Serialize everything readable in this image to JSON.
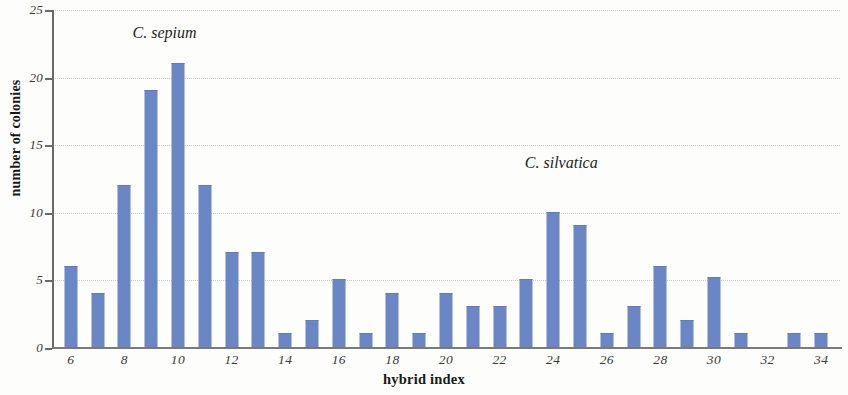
{
  "chart_data": {
    "type": "bar",
    "title": "",
    "subtitle": "",
    "xlabel": "hybrid index",
    "ylabel": "number of colonies",
    "categories": [
      6,
      7,
      8,
      9,
      10,
      11,
      12,
      13,
      14,
      15,
      16,
      17,
      18,
      19,
      20,
      21,
      22,
      23,
      24,
      25,
      26,
      27,
      28,
      29,
      30,
      31,
      32,
      33,
      34
    ],
    "values": [
      6,
      4,
      12,
      19,
      21,
      12,
      7,
      7,
      1,
      2,
      5,
      1,
      4,
      1,
      4,
      3,
      3,
      5,
      10,
      9,
      1,
      3,
      6,
      2,
      5.2,
      1,
      0,
      1,
      1
    ],
    "xlim": [
      5.3,
      34.7
    ],
    "ylim": [
      0,
      25
    ],
    "xticks": [
      6,
      8,
      10,
      12,
      14,
      16,
      18,
      20,
      22,
      24,
      26,
      28,
      30,
      32,
      34
    ],
    "yticks": [
      0,
      5,
      10,
      15,
      20,
      25
    ],
    "xtick_labels": [
      "6",
      "8",
      "10",
      "12",
      "14",
      "16",
      "18",
      "20",
      "22",
      "24",
      "26",
      "28",
      "30",
      "32",
      "34"
    ],
    "ytick_labels": [
      "0",
      "5",
      "10",
      "15",
      "20",
      "25"
    ],
    "grid": "horizontal-dotted",
    "legend": "none",
    "bar_color": "#6b86c4",
    "background_color": "#fdfdfc",
    "gridline_color": "#c9c9c9",
    "axis_color": "#6a6a68",
    "annotations": [
      {
        "text": "C. sepium",
        "x": 9.5,
        "y": 23.2
      },
      {
        "text": "C. silvatica",
        "x": 24.3,
        "y": 13.6
      }
    ]
  }
}
